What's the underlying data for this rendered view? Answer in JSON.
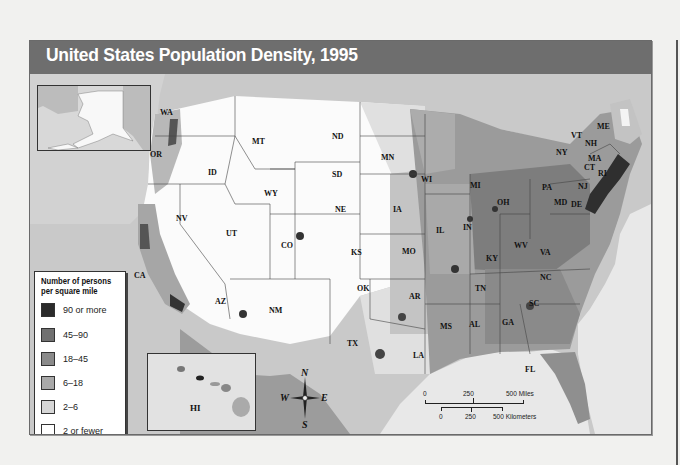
{
  "title": "United States Population Density, 1995",
  "legend": {
    "title_line1": "Number of persons",
    "title_line2": "per square mile",
    "items": [
      {
        "label": "90 or more",
        "color": "#2b2b2b"
      },
      {
        "label": "45–90",
        "color": "#707070"
      },
      {
        "label": "18–45",
        "color": "#8a8a8a"
      },
      {
        "label": "6–18",
        "color": "#a9a9a9"
      },
      {
        "label": "2–6",
        "color": "#d6d6d6"
      },
      {
        "label": "2 or fewer",
        "color": "#ffffff"
      }
    ]
  },
  "insets": {
    "alaska": {
      "label": ""
    },
    "hawaii": {
      "label": "HI"
    }
  },
  "compass": {
    "n": "N",
    "s": "S",
    "e": "E",
    "w": "W"
  },
  "scale": {
    "miles": {
      "zero": "0",
      "mid": "250",
      "end": "500 Miles"
    },
    "km": {
      "zero": "0",
      "mid": "250",
      "end": "500 Kilometers"
    }
  },
  "states": [
    {
      "abbr": "WA",
      "x": 160,
      "y": 38
    },
    {
      "abbr": "OR",
      "x": 150,
      "y": 80
    },
    {
      "abbr": "CA",
      "x": 134,
      "y": 201
    },
    {
      "abbr": "NV",
      "x": 176,
      "y": 144
    },
    {
      "abbr": "ID",
      "x": 208,
      "y": 98
    },
    {
      "abbr": "MT",
      "x": 252,
      "y": 67
    },
    {
      "abbr": "WY",
      "x": 264,
      "y": 119
    },
    {
      "abbr": "UT",
      "x": 226,
      "y": 159
    },
    {
      "abbr": "AZ",
      "x": 215,
      "y": 227
    },
    {
      "abbr": "CO",
      "x": 281,
      "y": 171
    },
    {
      "abbr": "NM",
      "x": 269,
      "y": 236
    },
    {
      "abbr": "ND",
      "x": 332,
      "y": 62
    },
    {
      "abbr": "SD",
      "x": 332,
      "y": 100
    },
    {
      "abbr": "NE",
      "x": 335,
      "y": 135
    },
    {
      "abbr": "KS",
      "x": 351,
      "y": 178
    },
    {
      "abbr": "OK",
      "x": 357,
      "y": 214
    },
    {
      "abbr": "TX",
      "x": 347,
      "y": 269
    },
    {
      "abbr": "MN",
      "x": 381,
      "y": 83
    },
    {
      "abbr": "IA",
      "x": 393,
      "y": 135
    },
    {
      "abbr": "MO",
      "x": 402,
      "y": 177
    },
    {
      "abbr": "AR",
      "x": 409,
      "y": 222
    },
    {
      "abbr": "LA",
      "x": 413,
      "y": 281
    },
    {
      "abbr": "WI",
      "x": 421,
      "y": 105
    },
    {
      "abbr": "IL",
      "x": 436,
      "y": 156
    },
    {
      "abbr": "MS",
      "x": 440,
      "y": 252
    },
    {
      "abbr": "MI",
      "x": 470,
      "y": 111
    },
    {
      "abbr": "IN",
      "x": 463,
      "y": 153
    },
    {
      "abbr": "KY",
      "x": 486,
      "y": 184
    },
    {
      "abbr": "TN",
      "x": 475,
      "y": 214
    },
    {
      "abbr": "AL",
      "x": 469,
      "y": 250
    },
    {
      "abbr": "OH",
      "x": 497,
      "y": 128
    },
    {
      "abbr": "GA",
      "x": 502,
      "y": 248
    },
    {
      "abbr": "FL",
      "x": 525,
      "y": 295
    },
    {
      "abbr": "WV",
      "x": 514,
      "y": 171
    },
    {
      "abbr": "VA",
      "x": 540,
      "y": 178
    },
    {
      "abbr": "NC",
      "x": 540,
      "y": 203
    },
    {
      "abbr": "SC",
      "x": 529,
      "y": 229
    },
    {
      "abbr": "PA",
      "x": 542,
      "y": 113
    },
    {
      "abbr": "NY",
      "x": 556,
      "y": 78
    },
    {
      "abbr": "VT",
      "x": 571,
      "y": 61
    },
    {
      "abbr": "NH",
      "x": 585,
      "y": 69
    },
    {
      "abbr": "ME",
      "x": 597,
      "y": 52
    },
    {
      "abbr": "MA",
      "x": 588,
      "y": 84
    },
    {
      "abbr": "CT",
      "x": 584,
      "y": 93
    },
    {
      "abbr": "RI",
      "x": 598,
      "y": 99
    },
    {
      "abbr": "NJ",
      "x": 578,
      "y": 112
    },
    {
      "abbr": "MD",
      "x": 554,
      "y": 128
    },
    {
      "abbr": "DE",
      "x": 571,
      "y": 130
    }
  ]
}
